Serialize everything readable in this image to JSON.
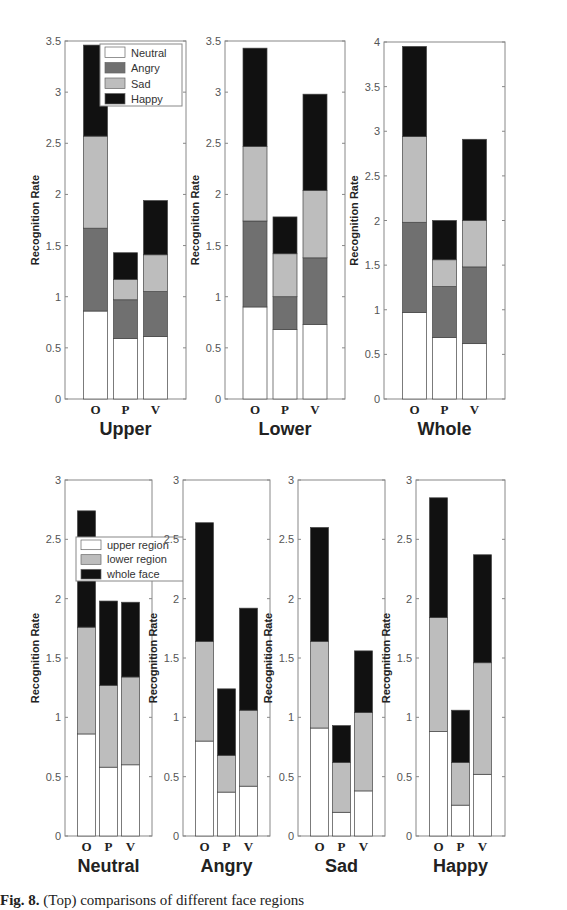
{
  "chart_data": [
    {
      "type": "bar",
      "stacked": true,
      "title": "Upper",
      "xlabel": "Upper",
      "ylabel": "Recognition Rate",
      "categories": [
        "O",
        "P",
        "V"
      ],
      "ylim": [
        0,
        3.5
      ],
      "yticks": [
        0,
        0.5,
        1,
        1.5,
        2,
        2.5,
        3,
        3.5
      ],
      "legend": "top-right",
      "series": [
        {
          "name": "Neutral",
          "values": [
            0.86,
            0.59,
            0.61
          ]
        },
        {
          "name": "Angry",
          "values": [
            0.81,
            0.38,
            0.44
          ]
        },
        {
          "name": "Sad",
          "values": [
            0.9,
            0.2,
            0.36
          ]
        },
        {
          "name": "Happy",
          "values": [
            0.89,
            0.26,
            0.53
          ]
        }
      ]
    },
    {
      "type": "bar",
      "stacked": true,
      "title": "Lower",
      "xlabel": "Lower",
      "ylabel": "Recognition Rate",
      "categories": [
        "O",
        "P",
        "V"
      ],
      "ylim": [
        0,
        3.5
      ],
      "yticks": [
        0,
        0.5,
        1,
        1.5,
        2,
        2.5,
        3,
        3.5
      ],
      "series": [
        {
          "name": "Neutral",
          "values": [
            0.9,
            0.68,
            0.73
          ]
        },
        {
          "name": "Angry",
          "values": [
            0.84,
            0.32,
            0.65
          ]
        },
        {
          "name": "Sad",
          "values": [
            0.73,
            0.42,
            0.66
          ]
        },
        {
          "name": "Happy",
          "values": [
            0.96,
            0.36,
            0.94
          ]
        }
      ]
    },
    {
      "type": "bar",
      "stacked": true,
      "title": "Whole",
      "xlabel": "Whole",
      "ylabel": "Recognition Rate",
      "categories": [
        "O",
        "P",
        "V"
      ],
      "ylim": [
        0,
        4
      ],
      "yticks": [
        0,
        0.5,
        1,
        1.5,
        2,
        2.5,
        3,
        3.5,
        4
      ],
      "series": [
        {
          "name": "Neutral",
          "values": [
            0.97,
            0.69,
            0.62
          ]
        },
        {
          "name": "Angry",
          "values": [
            1.01,
            0.57,
            0.86
          ]
        },
        {
          "name": "Sad",
          "values": [
            0.96,
            0.3,
            0.52
          ]
        },
        {
          "name": "Happy",
          "values": [
            1.01,
            0.44,
            0.91
          ]
        }
      ]
    },
    {
      "type": "bar",
      "stacked": true,
      "title": "Neutral",
      "xlabel": "Neutral",
      "ylabel": "Recognition Rate",
      "categories": [
        "O",
        "P",
        "V"
      ],
      "ylim": [
        0,
        3
      ],
      "yticks": [
        0,
        0.5,
        1,
        1.5,
        2,
        2.5,
        3
      ],
      "legend": "top-right",
      "series": [
        {
          "name": "upper region",
          "values": [
            0.86,
            0.58,
            0.6
          ]
        },
        {
          "name": "lower region",
          "values": [
            0.9,
            0.69,
            0.74
          ]
        },
        {
          "name": "whole face",
          "values": [
            0.98,
            0.71,
            0.63
          ]
        }
      ]
    },
    {
      "type": "bar",
      "stacked": true,
      "title": "Angry",
      "xlabel": "Angry",
      "ylabel": "Recognition Rate",
      "categories": [
        "O",
        "P",
        "V"
      ],
      "ylim": [
        0,
        3
      ],
      "yticks": [
        0,
        0.5,
        1,
        1.5,
        2,
        2.5,
        3
      ],
      "series": [
        {
          "name": "upper region",
          "values": [
            0.8,
            0.37,
            0.42
          ]
        },
        {
          "name": "lower region",
          "values": [
            0.84,
            0.31,
            0.64
          ]
        },
        {
          "name": "whole face",
          "values": [
            1.0,
            0.56,
            0.86
          ]
        }
      ]
    },
    {
      "type": "bar",
      "stacked": true,
      "title": "Sad",
      "xlabel": "Sad",
      "ylabel": "Recognition Rate",
      "categories": [
        "O",
        "P",
        "V"
      ],
      "ylim": [
        0,
        3
      ],
      "yticks": [
        0,
        0.5,
        1,
        1.5,
        2,
        2.5,
        3
      ],
      "series": [
        {
          "name": "upper region",
          "values": [
            0.91,
            0.2,
            0.38
          ]
        },
        {
          "name": "lower region",
          "values": [
            0.73,
            0.42,
            0.66
          ]
        },
        {
          "name": "whole face",
          "values": [
            0.96,
            0.31,
            0.52
          ]
        }
      ]
    },
    {
      "type": "bar",
      "stacked": true,
      "title": "Happy",
      "xlabel": "Happy",
      "ylabel": "Recognition Rate",
      "categories": [
        "O",
        "P",
        "V"
      ],
      "ylim": [
        0,
        3
      ],
      "yticks": [
        0,
        0.5,
        1,
        1.5,
        2,
        2.5,
        3
      ],
      "series": [
        {
          "name": "upper region",
          "values": [
            0.88,
            0.26,
            0.52
          ]
        },
        {
          "name": "lower region",
          "values": [
            0.96,
            0.36,
            0.94
          ]
        },
        {
          "name": "whole face",
          "values": [
            1.01,
            0.44,
            0.91
          ]
        }
      ]
    }
  ],
  "colors": {
    "Neutral": "#ffffff",
    "Angry": "#707070",
    "Sad": "#bdbdbd",
    "Happy": "#111111",
    "upper region": "#ffffff",
    "lower region": "#bdbdbd",
    "whole face": "#111111"
  },
  "caption": {
    "label": "Fig. 8.",
    "text": "(Top) comparisons of different face regions"
  }
}
